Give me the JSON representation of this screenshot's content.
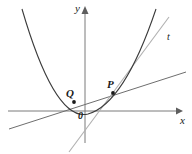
{
  "figure": {
    "width": 192,
    "height": 154,
    "background": "#ffffff"
  },
  "axes": {
    "x_label": "x",
    "y_label": "y",
    "origin_label": "0",
    "origin_px": {
      "x": 85,
      "y": 111
    },
    "x_axis": {
      "x1": 8,
      "y1": 111,
      "x2": 178,
      "y2": 111,
      "color": "#7a7a7a",
      "arrow": "right"
    },
    "y_axis": {
      "x1": 85,
      "y1": 143,
      "x2": 85,
      "y2": 12,
      "color": "#7a7a7a",
      "arrow": "up"
    }
  },
  "labels": {
    "point_p": "P",
    "point_q": "Q",
    "tangent": "t",
    "x": "x",
    "y": "y",
    "origin": "0"
  },
  "curves": {
    "parabola": {
      "name": "parabola",
      "color": "#3b3b3b",
      "stroke_width": 1.1,
      "vertex_px": {
        "x": 88,
        "y": 114
      },
      "path": "M 22,9 Q 55,122 88,114 Q 124,104 156,9"
    },
    "tangent_line": {
      "name": "tangent-line-t",
      "color": "#b0b0b0",
      "stroke_width": 1.1,
      "x1": 69,
      "y1": 152,
      "x2": 169,
      "y2": 17
    },
    "secant_line": {
      "name": "secant-line-pq",
      "color": "#6e6e6e",
      "stroke_width": 1.0,
      "x1": 9,
      "y1": 129,
      "x2": 186,
      "y2": 72
    }
  },
  "points": {
    "P": {
      "label": "P",
      "x": 113,
      "y": 93,
      "r": 1.9,
      "color": "#1a1a1a"
    },
    "Q": {
      "label": "Q",
      "x": 74,
      "y": 102,
      "r": 1.9,
      "color": "#1a1a1a"
    }
  },
  "colors": {
    "curve": "#3b3b3b",
    "tangent": "#b0b0b0",
    "secant": "#6e6e6e",
    "axis": "#7a7a7a",
    "text": "#1a1a1a"
  }
}
